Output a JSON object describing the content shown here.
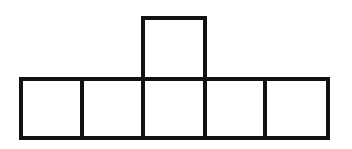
{
  "diagram": {
    "type": "cube-net",
    "stroke_color": "#111111",
    "fill_color": "#ffffff",
    "stroke_width": 4,
    "bottom_row": {
      "count": 5,
      "squares": [
        {
          "index": 0,
          "x": 19,
          "y": 77,
          "w": 65,
          "h": 63
        },
        {
          "index": 1,
          "x": 80,
          "y": 77,
          "w": 65,
          "h": 63
        },
        {
          "index": 2,
          "x": 141,
          "y": 77,
          "w": 66,
          "h": 63
        },
        {
          "index": 3,
          "x": 203,
          "y": 77,
          "w": 65,
          "h": 63
        },
        {
          "index": 4,
          "x": 263,
          "y": 77,
          "w": 67,
          "h": 63
        }
      ]
    },
    "top_square": {
      "above_index": 2,
      "x": 141,
      "y": 16,
      "w": 66,
      "h": 65
    }
  }
}
